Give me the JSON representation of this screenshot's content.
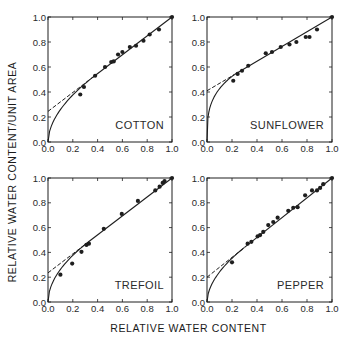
{
  "figure": {
    "ylabel": "RELATIVE WATER CONTENT/UNIT AREA",
    "xlabel": "RELATIVE WATER CONTENT"
  },
  "chart_data": [
    {
      "type": "scatter",
      "title": "COTTON",
      "xlabel": "RELATIVE WATER CONTENT",
      "ylabel": "RELATIVE WATER CONTENT/UNIT AREA",
      "xlim": [
        0,
        1
      ],
      "ylim": [
        0,
        1
      ],
      "xticks": [
        "0.0",
        "0.2",
        "0.4",
        "0.6",
        "0.8",
        "1.0"
      ],
      "yticks": [
        "0.0",
        "0.2",
        "0.4",
        "0.6",
        "0.8",
        "1.0"
      ],
      "points": [
        [
          0.26,
          0.38
        ],
        [
          0.29,
          0.44
        ],
        [
          0.38,
          0.53
        ],
        [
          0.46,
          0.6
        ],
        [
          0.51,
          0.64
        ],
        [
          0.53,
          0.645
        ],
        [
          0.565,
          0.7
        ],
        [
          0.6,
          0.72
        ],
        [
          0.66,
          0.76
        ],
        [
          0.71,
          0.77
        ],
        [
          0.77,
          0.81
        ],
        [
          0.82,
          0.86
        ],
        [
          0.895,
          0.9
        ],
        [
          1.0,
          1.0
        ]
      ],
      "dashed_line": {
        "intercept": 0.245,
        "slope": 0.755
      },
      "solid_curve_intercept": 0.0,
      "curve_join_x": 0.38
    },
    {
      "type": "scatter",
      "title": "SUNFLOWER",
      "xlabel": "RELATIVE WATER CONTENT",
      "ylabel": "RELATIVE WATER CONTENT/UNIT AREA",
      "xlim": [
        0,
        1
      ],
      "ylim": [
        0,
        1
      ],
      "xticks": [
        "0.0",
        "0.2",
        "0.4",
        "0.6",
        "0.8",
        "1.0"
      ],
      "yticks": [
        "0.0",
        "0.2",
        "0.4",
        "0.6",
        "0.8",
        "1.0"
      ],
      "points": [
        [
          0.21,
          0.49
        ],
        [
          0.245,
          0.545
        ],
        [
          0.28,
          0.57
        ],
        [
          0.33,
          0.61
        ],
        [
          0.47,
          0.71
        ],
        [
          0.52,
          0.72
        ],
        [
          0.59,
          0.76
        ],
        [
          0.66,
          0.78
        ],
        [
          0.715,
          0.8
        ],
        [
          0.79,
          0.84
        ],
        [
          0.82,
          0.84
        ],
        [
          0.88,
          0.9
        ],
        [
          1.0,
          1.0
        ]
      ],
      "dashed_line": {
        "intercept": 0.41,
        "slope": 0.59
      },
      "solid_curve_intercept": 0.0,
      "curve_join_x": 0.22
    },
    {
      "type": "scatter",
      "title": "TREFOIL",
      "xlabel": "RELATIVE WATER CONTENT",
      "ylabel": "RELATIVE WATER CONTENT/UNIT AREA",
      "xlim": [
        0,
        1
      ],
      "ylim": [
        0,
        1
      ],
      "xticks": [
        "0.0",
        "0.2",
        "0.4",
        "0.6",
        "0.8",
        "1.0"
      ],
      "yticks": [
        "0.0",
        "0.2",
        "0.4",
        "0.6",
        "0.8",
        "1.0"
      ],
      "points": [
        [
          0.1,
          0.22
        ],
        [
          0.195,
          0.31
        ],
        [
          0.27,
          0.405
        ],
        [
          0.31,
          0.46
        ],
        [
          0.33,
          0.47
        ],
        [
          0.45,
          0.59
        ],
        [
          0.595,
          0.71
        ],
        [
          0.725,
          0.815
        ],
        [
          0.865,
          0.9
        ],
        [
          0.9,
          0.93
        ],
        [
          0.925,
          0.96
        ],
        [
          0.94,
          0.975
        ],
        [
          1.0,
          1.0
        ]
      ],
      "dashed_line": {
        "intercept": 0.235,
        "slope": 0.765
      },
      "solid_curve_intercept": 0.0,
      "curve_join_x": 0.33
    },
    {
      "type": "scatter",
      "title": "PEPPER",
      "xlabel": "RELATIVE WATER CONTENT",
      "ylabel": "RELATIVE WATER CONTENT/UNIT AREA",
      "xlim": [
        0,
        1
      ],
      "ylim": [
        0,
        1
      ],
      "xticks": [
        "0.0",
        "0.2",
        "0.4",
        "0.6",
        "0.8",
        "1.0"
      ],
      "yticks": [
        "0.0",
        "0.2",
        "0.4",
        "0.6",
        "0.8",
        "1.0"
      ],
      "points": [
        [
          0.2,
          0.32
        ],
        [
          0.325,
          0.47
        ],
        [
          0.355,
          0.485
        ],
        [
          0.405,
          0.53
        ],
        [
          0.425,
          0.54
        ],
        [
          0.45,
          0.565
        ],
        [
          0.49,
          0.62
        ],
        [
          0.53,
          0.645
        ],
        [
          0.565,
          0.68
        ],
        [
          0.65,
          0.735
        ],
        [
          0.69,
          0.76
        ],
        [
          0.725,
          0.765
        ],
        [
          0.785,
          0.86
        ],
        [
          0.84,
          0.9
        ],
        [
          0.88,
          0.9
        ],
        [
          0.905,
          0.92
        ],
        [
          0.93,
          0.95
        ],
        [
          1.0,
          1.0
        ]
      ],
      "dashed_line": {
        "intercept": 0.2,
        "slope": 0.8
      },
      "solid_curve_intercept": 0.0,
      "curve_join_x": 0.3
    }
  ],
  "layout": {
    "panels": [
      {
        "x0": 48,
        "x1": 172,
        "y0": 17,
        "y1": 142
      },
      {
        "x0": 207,
        "x1": 332,
        "y0": 17,
        "y1": 142
      },
      {
        "x0": 48,
        "x1": 172,
        "y0": 178,
        "y1": 302
      },
      {
        "x0": 207,
        "x1": 332,
        "y0": 178,
        "y1": 302
      }
    ],
    "ink_color": "#1e1e1e",
    "label_color": "#2a2a2a"
  }
}
